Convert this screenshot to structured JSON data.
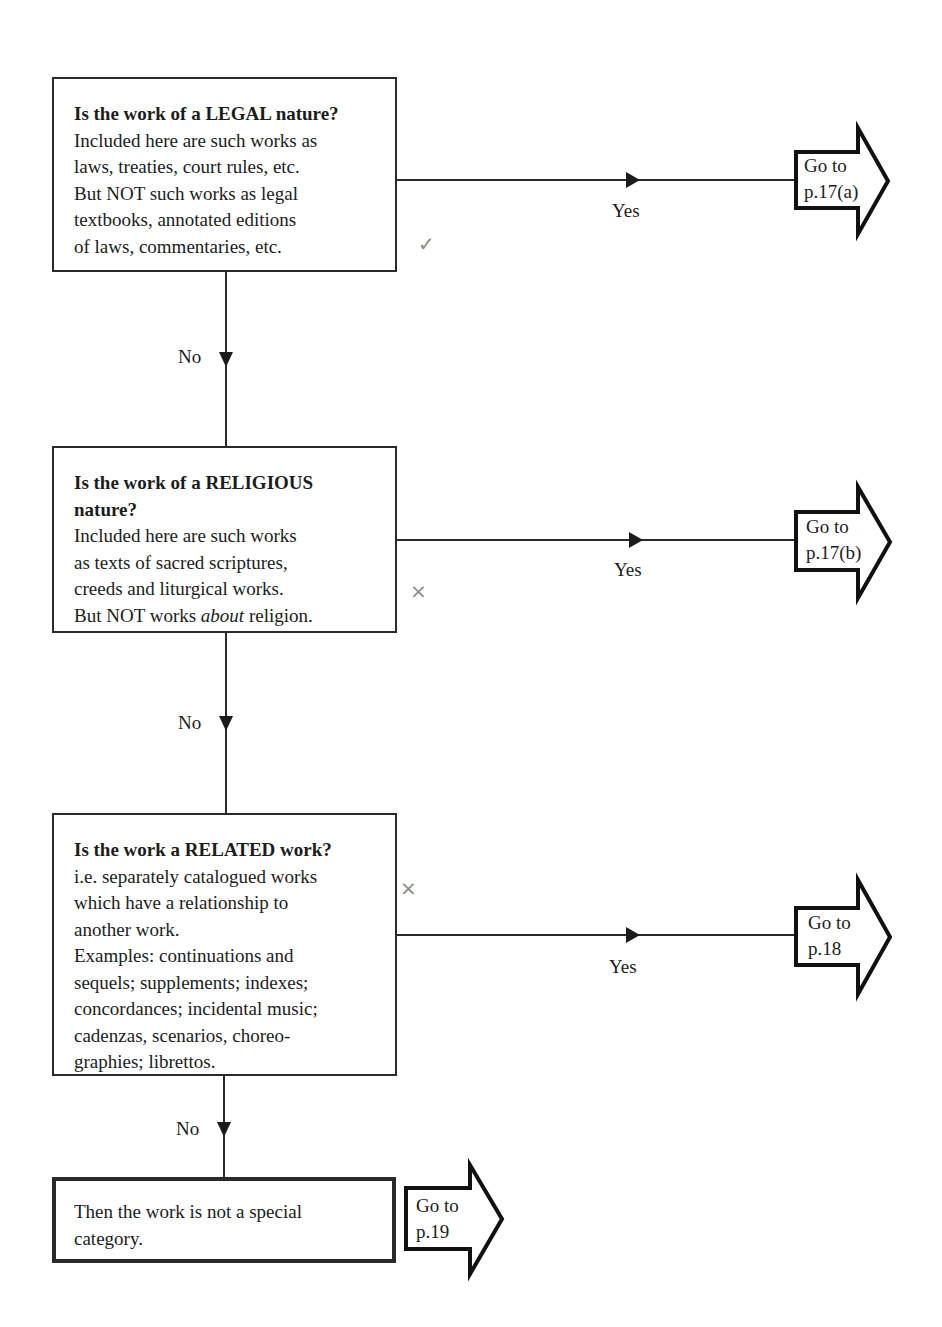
{
  "questions": [
    {
      "title": "Is the work of a LEGAL nature?",
      "lines": [
        "Included here are such works as",
        "laws, treaties, court rules, etc.",
        "But NOT such works as legal",
        "textbooks, annotated editions",
        "of laws, commentaries, etc."
      ],
      "yes_label": "Yes",
      "no_label": "No",
      "goto": {
        "line1": "Go to",
        "line2": "p.17(a)"
      }
    },
    {
      "title_line1": "Is the work of a RELIGIOUS",
      "title_line2": "nature?",
      "lines": [
        "Included here are such works",
        "as texts of sacred scriptures,",
        "creeds and liturgical works."
      ],
      "last_line": {
        "pre": "But NOT works ",
        "emph": "about",
        "post": " religion."
      },
      "yes_label": "Yes",
      "no_label": "No",
      "goto": {
        "line1": "Go to",
        "line2": "p.17(b)"
      }
    },
    {
      "title": "Is the work a RELATED work?",
      "lines": [
        "i.e. separately catalogued works",
        "which have a relationship to",
        "another work.",
        "Examples: continuations and",
        "sequels; supplements; indexes;",
        "concordances; incidental music;",
        "cadenzas, scenarios, choreo-",
        "graphies; librettos."
      ],
      "yes_label": "Yes",
      "no_label": "No",
      "goto": {
        "line1": "Go to",
        "line2": "p.18"
      }
    }
  ],
  "final": {
    "lines": [
      "Then the work is not a special",
      "category."
    ],
    "goto": {
      "line1": "Go to",
      "line2": "p.19"
    }
  },
  "margin_marks": [
    "✓",
    "×",
    "×"
  ],
  "colors": {
    "ink": "#1c1c1c",
    "pencil": "#8a8a8a",
    "paper": "#ffffff"
  }
}
